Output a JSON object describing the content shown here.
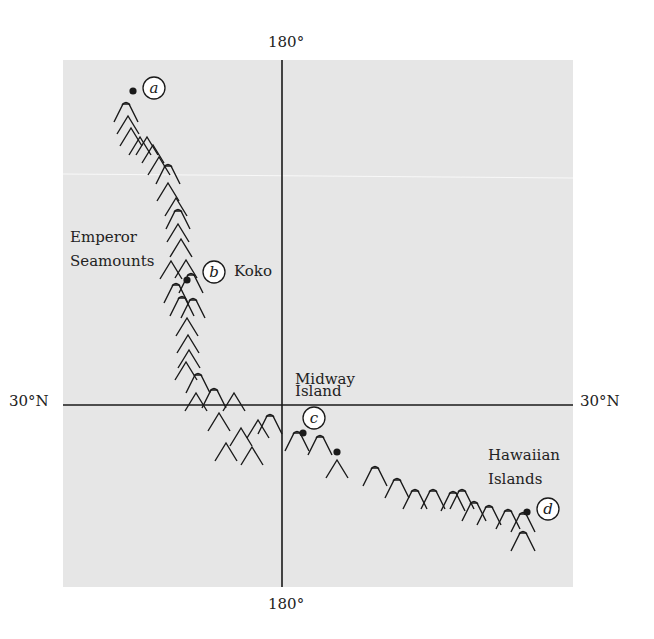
{
  "axes": {
    "meridian_top": "180°",
    "meridian_bottom": "180°",
    "parallel_left": "30°N",
    "parallel_right": "30°N"
  },
  "labels": {
    "emperor_line1": "Emperor",
    "emperor_line2": "Seamounts",
    "koko": "Koko",
    "midway_line1": "Midway",
    "midway_line2": "Island",
    "hawaiian_line1": "Hawaiian",
    "hawaiian_line2": "Islands"
  },
  "markers": [
    {
      "id": "a",
      "label": "a",
      "dot": [
        133,
        91
      ],
      "circle": [
        154,
        88
      ]
    },
    {
      "id": "b",
      "label": "b",
      "dot": [
        187,
        280
      ],
      "circle": [
        214,
        272
      ]
    },
    {
      "id": "c",
      "label": "c",
      "dot": [
        303,
        433
      ],
      "circle": [
        314,
        418
      ]
    },
    {
      "id": "d",
      "label": "d",
      "dot": [
        527,
        512
      ],
      "circle": [
        548,
        509
      ]
    }
  ],
  "extra_dots": [
    [
      337,
      452
    ]
  ],
  "seamounts": [
    {
      "x": 126,
      "y": 104,
      "flat": true
    },
    {
      "x": 128,
      "y": 116,
      "flat": false
    },
    {
      "x": 131,
      "y": 128,
      "flat": false
    },
    {
      "x": 140,
      "y": 137,
      "flat": false
    },
    {
      "x": 147,
      "y": 137,
      "flat": false
    },
    {
      "x": 153,
      "y": 145,
      "flat": false
    },
    {
      "x": 159,
      "y": 157,
      "flat": false
    },
    {
      "x": 168,
      "y": 166,
      "flat": true
    },
    {
      "x": 168,
      "y": 183,
      "flat": false
    },
    {
      "x": 176,
      "y": 198,
      "flat": false
    },
    {
      "x": 178,
      "y": 211,
      "flat": true
    },
    {
      "x": 178,
      "y": 224,
      "flat": false
    },
    {
      "x": 181,
      "y": 239,
      "flat": false
    },
    {
      "x": 171,
      "y": 261,
      "flat": false
    },
    {
      "x": 186,
      "y": 260,
      "flat": false
    },
    {
      "x": 191,
      "y": 275,
      "flat": true
    },
    {
      "x": 176,
      "y": 285,
      "flat": true
    },
    {
      "x": 182,
      "y": 298,
      "flat": true
    },
    {
      "x": 193,
      "y": 300,
      "flat": true
    },
    {
      "x": 187,
      "y": 318,
      "flat": false
    },
    {
      "x": 188,
      "y": 335,
      "flat": false
    },
    {
      "x": 189,
      "y": 350,
      "flat": false
    },
    {
      "x": 186,
      "y": 362,
      "flat": false
    },
    {
      "x": 198,
      "y": 375,
      "flat": true
    },
    {
      "x": 196,
      "y": 393,
      "flat": false
    },
    {
      "x": 214,
      "y": 390,
      "flat": true
    },
    {
      "x": 234,
      "y": 393,
      "flat": false
    },
    {
      "x": 219,
      "y": 413,
      "flat": false
    },
    {
      "x": 241,
      "y": 428,
      "flat": false
    },
    {
      "x": 226,
      "y": 443,
      "flat": false
    },
    {
      "x": 252,
      "y": 447,
      "flat": false
    },
    {
      "x": 258,
      "y": 420,
      "flat": false
    },
    {
      "x": 270,
      "y": 416,
      "flat": true
    },
    {
      "x": 297,
      "y": 433,
      "flat": true
    },
    {
      "x": 320,
      "y": 437,
      "flat": true
    },
    {
      "x": 337,
      "y": 460,
      "flat": false
    },
    {
      "x": 375,
      "y": 468,
      "flat": true
    },
    {
      "x": 397,
      "y": 480,
      "flat": true
    },
    {
      "x": 415,
      "y": 491,
      "flat": true
    },
    {
      "x": 433,
      "y": 491,
      "flat": true
    },
    {
      "x": 453,
      "y": 493,
      "flat": true
    },
    {
      "x": 462,
      "y": 491,
      "flat": true
    },
    {
      "x": 474,
      "y": 503,
      "flat": true
    },
    {
      "x": 489,
      "y": 507,
      "flat": true
    },
    {
      "x": 508,
      "y": 511,
      "flat": true
    },
    {
      "x": 523,
      "y": 514,
      "flat": true
    },
    {
      "x": 523,
      "y": 533,
      "flat": true
    }
  ],
  "colors": {
    "map_background": "#e6e6e6",
    "ink": "#1a1a1a",
    "page": "#ffffff"
  }
}
